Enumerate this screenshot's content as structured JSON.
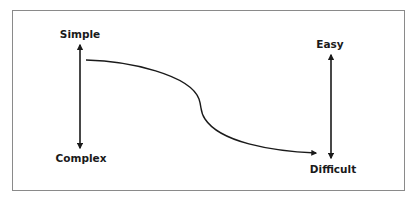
{
  "diagram": {
    "top_caption_fragment": "",
    "left_axis": {
      "top_label": "Simple",
      "bottom_label": "Complex"
    },
    "right_axis": {
      "top_label": "Easy",
      "bottom_label": "Difficult"
    },
    "curve": {
      "description": "S-shaped curve from Simple/top-left descending to Difficult/bottom-right, ending with an arrowhead"
    },
    "colors": {
      "stroke": "#1a1a1a",
      "frame": "#8a8a8a",
      "background": "#ffffff"
    }
  }
}
